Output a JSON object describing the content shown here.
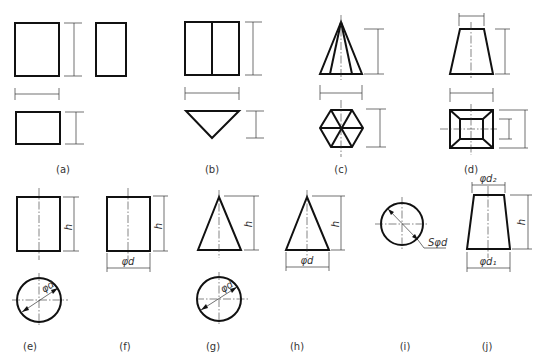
{
  "figure": {
    "labels": {
      "a": "(a)",
      "b": "(b)",
      "c": "(c)",
      "d": "(d)",
      "e": "(e)",
      "f": "(f)",
      "g": "(g)",
      "h": "(h)",
      "i": "(i)",
      "j": "(j)"
    },
    "dimensions": {
      "height": "h",
      "diameter": "φd",
      "sphere_diameter": "Sφd",
      "diameter_bottom": "φd₁",
      "diameter_top": "φd₂"
    },
    "descriptions": {
      "a": "rectangular prism (three views)",
      "b": "triangular prism",
      "c": "hexagonal pyramid",
      "d": "truncated square pyramid",
      "e": "cylinder with diameter in top view",
      "f": "cylinder single view",
      "g": "cone with diameter in top view",
      "h": "cone single view",
      "i": "sphere",
      "j": "truncated cone"
    }
  }
}
